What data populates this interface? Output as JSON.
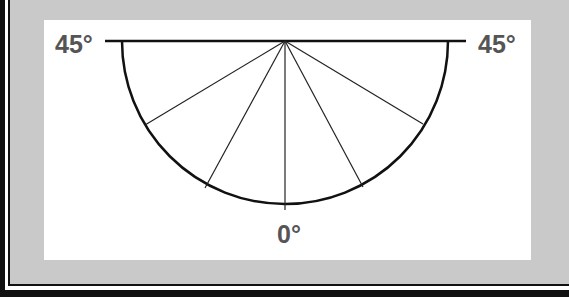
{
  "diagram": {
    "type": "protractor-semicircle",
    "labels": {
      "left": "45°",
      "right": "45°",
      "bottom": "0°"
    },
    "apex": {
      "x": 285,
      "y": 41
    },
    "radius": 163,
    "baseline": {
      "x1": 105,
      "x2": 466,
      "y": 41
    },
    "radial_lines": [
      {
        "x": 145,
        "y": 125
      },
      {
        "x": 205,
        "y": 188
      },
      {
        "x": 285,
        "y": 210
      },
      {
        "x": 363,
        "y": 187
      },
      {
        "x": 423,
        "y": 124
      }
    ],
    "colors": {
      "background": "#c9c9c9",
      "panel": "#ffffff",
      "line": "#111111",
      "label": "#555555"
    }
  }
}
